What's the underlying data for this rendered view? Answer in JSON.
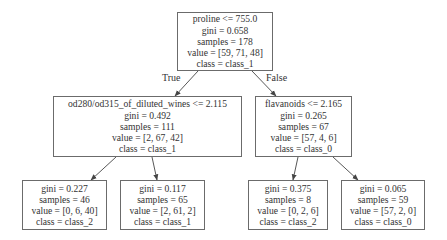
{
  "tree": {
    "colors": {
      "border": "#6b6b6b",
      "edge": "#444444",
      "text": "#333333",
      "background": "#ffffff"
    },
    "nodes": [
      {
        "id": "n0",
        "box": [
          177,
          12,
          96,
          59
        ],
        "lines": [
          "proline <= 755.0",
          "gini = 0.658",
          "samples = 178",
          "value = [59, 71, 48]",
          "class = class_1"
        ]
      },
      {
        "id": "n1",
        "box": [
          53,
          96,
          189,
          61
        ],
        "lines": [
          "od280/od315_of_diluted_wines <= 2.115",
          "gini = 0.492",
          "samples = 111",
          "value = [2, 67, 42]",
          "class = class_1"
        ]
      },
      {
        "id": "n2",
        "box": [
          255,
          96,
          97,
          61
        ],
        "lines": [
          "flavanoids <= 2.165",
          "gini = 0.265",
          "samples = 67",
          "value = [57, 4, 6]",
          "class = class_0"
        ]
      },
      {
        "id": "n3",
        "box": [
          22,
          180,
          85,
          50
        ],
        "lines": [
          "gini = 0.227",
          "samples = 46",
          "value = [0, 6, 40]",
          "class = class_2"
        ]
      },
      {
        "id": "n4",
        "box": [
          120,
          180,
          85,
          50
        ],
        "lines": [
          "gini = 0.117",
          "samples = 65",
          "value = [2, 61, 2]",
          "class = class_1"
        ]
      },
      {
        "id": "n5",
        "box": [
          248,
          180,
          80,
          50
        ],
        "lines": [
          "gini = 0.375",
          "samples = 8",
          "value = [0, 2, 6]",
          "class = class_2"
        ]
      },
      {
        "id": "n6",
        "box": [
          341,
          180,
          84,
          50
        ],
        "lines": [
          "gini = 0.065",
          "samples = 59",
          "value = [57, 2, 0]",
          "class = class_0"
        ]
      }
    ],
    "edges": [
      {
        "from": "n0",
        "to": "n1",
        "line": [
          198,
          71,
          175,
          96
        ],
        "label": "True",
        "label_pos": [
          162,
          72
        ]
      },
      {
        "from": "n0",
        "to": "n2",
        "line": [
          252,
          71,
          276,
          96
        ],
        "label": "False",
        "label_pos": [
          266,
          72
        ]
      },
      {
        "from": "n1",
        "to": "n3",
        "line": [
          116,
          157,
          91,
          180
        ]
      },
      {
        "from": "n1",
        "to": "n4",
        "line": [
          152,
          157,
          157,
          180
        ]
      },
      {
        "from": "n2",
        "to": "n5",
        "line": [
          298,
          157,
          293,
          180
        ]
      },
      {
        "from": "n2",
        "to": "n6",
        "line": [
          333,
          157,
          358,
          180
        ]
      }
    ]
  }
}
